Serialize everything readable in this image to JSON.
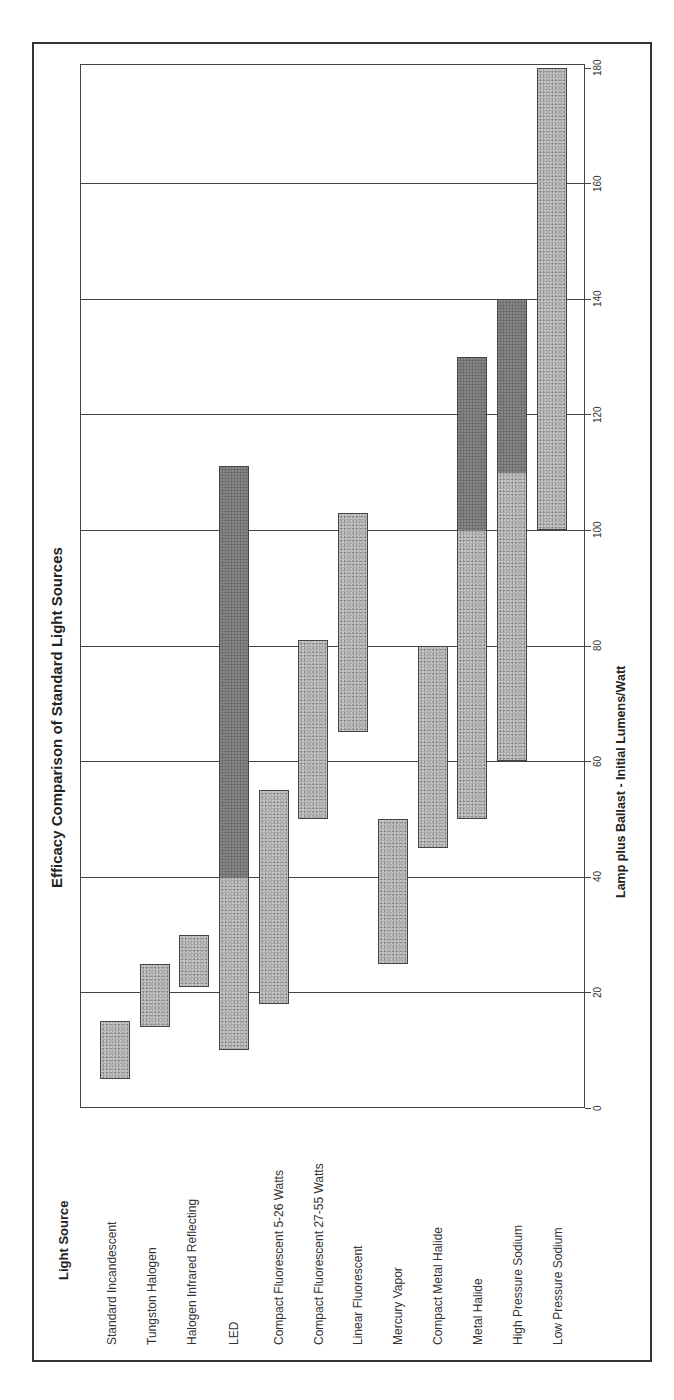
{
  "chart_data": {
    "type": "bar",
    "orientation": "floating-range (rotated 90° counter-clockwise on page)",
    "title": "Efficacy Comparison of Standard Light Sources",
    "category_header": "Light Source",
    "xlabel": "Lamp plus Ballast - Initial Lumens/Watt",
    "ylabel": "",
    "axis_range": [
      0,
      180
    ],
    "ticks": [
      0,
      20,
      40,
      60,
      80,
      100,
      120,
      140,
      160,
      180
    ],
    "grid": true,
    "legend": null,
    "categories": [
      "Standard Incandescent",
      "Tungston Halogen",
      "Halogen Infrared Reflecting",
      "LED",
      "Compact Fluorescent 5-26 Watts",
      "Compact Fluorescent 27-55 Watts",
      "Linear Fluorescent",
      "Mercury Vapor",
      "Compact Metal Halide",
      "Metal Halide",
      "High Pressure Sodium",
      "Low Pressure Sodium"
    ],
    "ranges": [
      {
        "name": "Standard Incandescent",
        "min": 5,
        "max": 15
      },
      {
        "name": "Tungston Halogen",
        "min": 14,
        "max": 25
      },
      {
        "name": "Halogen Infrared Reflecting",
        "min": 21,
        "max": 30
      },
      {
        "name": "LED",
        "min": 10,
        "max": 111,
        "dark_from": 40
      },
      {
        "name": "Compact Fluorescent 5-26 Watts",
        "min": 18,
        "max": 55
      },
      {
        "name": "Compact Fluorescent 27-55 Watts",
        "min": 50,
        "max": 81
      },
      {
        "name": "Linear Fluorescent",
        "min": 65,
        "max": 103
      },
      {
        "name": "Mercury Vapor",
        "min": 25,
        "max": 50
      },
      {
        "name": "Compact Metal Halide",
        "min": 45,
        "max": 80
      },
      {
        "name": "Metal Halide",
        "min": 50,
        "max": 130,
        "dark_from": 100
      },
      {
        "name": "High Pressure Sodium",
        "min": 60,
        "max": 140,
        "dark_from": 110
      },
      {
        "name": "Low Pressure Sodium",
        "min": 100,
        "max": 180
      }
    ],
    "colors": {
      "bar": "#a9a9a9",
      "bar_dark": "#6e6e6e",
      "border": "#444444"
    }
  }
}
